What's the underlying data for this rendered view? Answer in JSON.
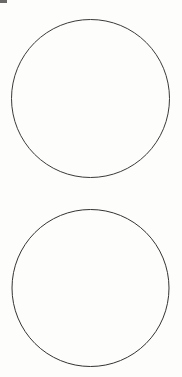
{
  "canvas": {
    "width": 182,
    "height": 377,
    "background_color": "#fdfdfb",
    "description": "Blank worksheet page with two large empty circle outlines stacked vertically"
  },
  "figure": {
    "shape_count": 2,
    "stroke_color": "#3a3a3a",
    "stroke_width": 1,
    "fill_color": "none",
    "shapes": [
      {
        "name": "circle-top",
        "type": "circle",
        "center_x": 90.5,
        "center_y": 98.5,
        "radius": 79,
        "stroke_color": "#3a3a3a",
        "stroke_width": 1,
        "fill_color": "none",
        "label": ""
      },
      {
        "name": "circle-bottom",
        "type": "circle",
        "center_x": 90.5,
        "center_y": 288,
        "radius": 78.5,
        "stroke_color": "#35332f",
        "stroke_width": 1,
        "fill_color": "none",
        "label": ""
      }
    ]
  },
  "artifacts": [
    {
      "name": "corner-smudge",
      "type": "scan-artifact",
      "x": 0,
      "y": 0,
      "width": 7,
      "height": 3,
      "color": "#4a4846"
    }
  ]
}
